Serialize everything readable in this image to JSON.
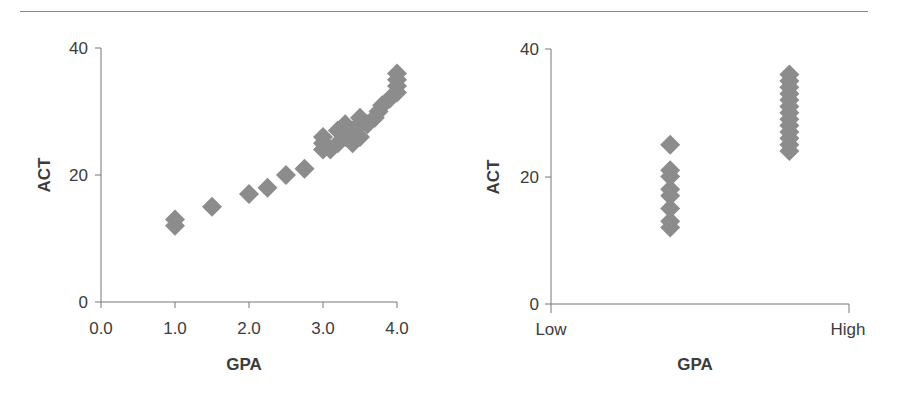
{
  "figure": {
    "marker_color": "#8c8c8c",
    "axis_color": "#777777",
    "text_color": "#3c3c3c"
  },
  "chart_data": [
    {
      "type": "scatter",
      "title": "",
      "xlabel": "GPA",
      "ylabel": "ACT",
      "xlim": [
        0.0,
        4.0
      ],
      "ylim": [
        0,
        40
      ],
      "x_ticks": [
        "0.0",
        "1.0",
        "2.0",
        "3.0",
        "4.0"
      ],
      "y_ticks": [
        "0",
        "20",
        "40"
      ],
      "grid": false,
      "marker": "diamond",
      "points": [
        {
          "x": 1.0,
          "y": 12
        },
        {
          "x": 1.0,
          "y": 13
        },
        {
          "x": 1.5,
          "y": 15
        },
        {
          "x": 2.0,
          "y": 17
        },
        {
          "x": 2.25,
          "y": 18
        },
        {
          "x": 2.5,
          "y": 20
        },
        {
          "x": 2.75,
          "y": 21
        },
        {
          "x": 3.0,
          "y": 24
        },
        {
          "x": 3.0,
          "y": 25
        },
        {
          "x": 3.0,
          "y": 26
        },
        {
          "x": 3.1,
          "y": 24
        },
        {
          "x": 3.2,
          "y": 25
        },
        {
          "x": 3.2,
          "y": 27
        },
        {
          "x": 3.3,
          "y": 26
        },
        {
          "x": 3.3,
          "y": 28
        },
        {
          "x": 3.4,
          "y": 25
        },
        {
          "x": 3.4,
          "y": 27
        },
        {
          "x": 3.5,
          "y": 26
        },
        {
          "x": 3.5,
          "y": 28
        },
        {
          "x": 3.5,
          "y": 29
        },
        {
          "x": 3.6,
          "y": 28
        },
        {
          "x": 3.7,
          "y": 29
        },
        {
          "x": 3.75,
          "y": 30
        },
        {
          "x": 3.8,
          "y": 31
        },
        {
          "x": 3.9,
          "y": 32
        },
        {
          "x": 4.0,
          "y": 33
        },
        {
          "x": 4.0,
          "y": 34
        },
        {
          "x": 4.0,
          "y": 35
        },
        {
          "x": 4.0,
          "y": 36
        }
      ]
    },
    {
      "type": "scatter",
      "title": "",
      "xlabel": "GPA",
      "ylabel": "ACT",
      "x_categories": [
        "Low",
        "High"
      ],
      "ylim": [
        0,
        40
      ],
      "y_ticks": [
        "0",
        "20",
        "40"
      ],
      "grid": false,
      "marker": "diamond",
      "series": [
        {
          "name": "Low GPA group",
          "x_position": 0.4,
          "values": [
            12,
            13,
            15,
            17,
            18,
            20,
            21,
            25
          ]
        },
        {
          "name": "High GPA group",
          "x_position": 0.8,
          "values": [
            24,
            25,
            26,
            27,
            28,
            29,
            30,
            31,
            32,
            33,
            34,
            35,
            36
          ]
        }
      ]
    }
  ]
}
